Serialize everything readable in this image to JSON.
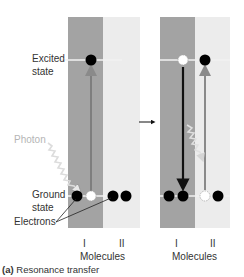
{
  "labels": {
    "excited_state_line1": "Excited",
    "excited_state_line2": "state",
    "photon": "Photon",
    "ground_state_line1": "Ground",
    "ground_state_line2": "state",
    "electrons": "Electrons"
  },
  "left_panel": {
    "molecule_labels": [
      "I",
      "II"
    ],
    "axis_label": "Molecules"
  },
  "right_panel": {
    "molecule_labels": [
      "I",
      "II"
    ],
    "axis_label": "Molecules"
  },
  "caption": {
    "prefix": "(a)",
    "text": "Resonance transfer"
  },
  "colors": {
    "molecule_I_band": "#a3a3a3",
    "molecule_II_band": "#ececec",
    "electron": "#000000",
    "arrow_up": "#8a8a8a",
    "arrow_down": "#111111",
    "photon": "#cfcfcf"
  }
}
